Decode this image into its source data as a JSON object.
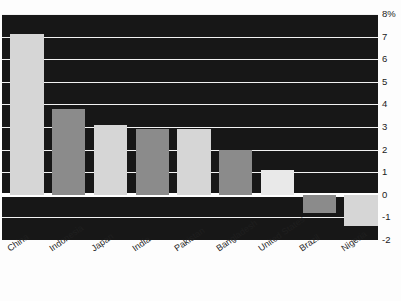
{
  "chart_data": {
    "type": "bar",
    "title": "",
    "subtitle": "",
    "xlabel": "",
    "ylabel": "",
    "unit_suffix": "%",
    "categories": [
      "China",
      "Indonesia",
      "Japan",
      "India",
      "Pakistan",
      "Bangladesh",
      "United States",
      "Brazil",
      "Nigeria"
    ],
    "values": [
      7.1,
      3.8,
      3.1,
      2.9,
      2.9,
      2.0,
      1.1,
      -0.8,
      -1.4
    ],
    "ylim": [
      -2,
      8
    ],
    "yticks": [
      8,
      7,
      6,
      5,
      4,
      3,
      2,
      1,
      0,
      -1,
      -2
    ],
    "ytick_labels": [
      "8%",
      "7",
      "6",
      "5",
      "4",
      "3",
      "2",
      "1",
      "0",
      "-1",
      "-2"
    ],
    "grid": true,
    "legend": "none",
    "bar_colors": [
      "#d6d6d6",
      "#8b8b8b",
      "#d6d6d6",
      "#8b8b8b",
      "#d6d6d6",
      "#8b8b8b",
      "#e9e9e9",
      "#8b8b8b",
      "#d6d6d6"
    ],
    "plot_background": "#171717",
    "gridline_color": "#f2f2f2",
    "zero_line_color": "#ffffff",
    "page_background": "#fdfdfd"
  }
}
